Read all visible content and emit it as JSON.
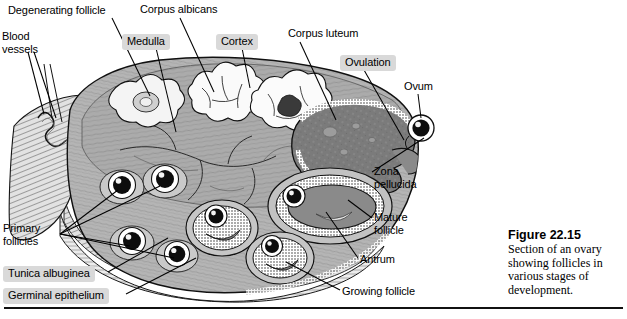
{
  "figure": {
    "number": "Figure 22.15",
    "caption": "Section of an ovary showing follicles in various stages of development."
  },
  "colors": {
    "highlight_box": "#d9d9d9",
    "stroke": "#000000",
    "cortex_fill": "#b3b3b3",
    "medulla_fill": "#a8a8a8",
    "corpus_luteum_fill": "#787878",
    "antrum_fill": "#8a8a8a",
    "follicle_nucleus": "#101010",
    "zona_pellucida": "#ffffff",
    "background": "#ffffff"
  },
  "labels": [
    {
      "id": "degenerating-follicle",
      "text": "Degenerating follicle",
      "highlight": false,
      "x": 8,
      "y": 4
    },
    {
      "id": "blood-vessels",
      "text": "Blood\nvessels",
      "highlight": false,
      "x": 2,
      "y": 30
    },
    {
      "id": "corpus-albicans",
      "text": "Corpus albicans",
      "highlight": false,
      "x": 140,
      "y": 3
    },
    {
      "id": "medulla",
      "text": "Medulla",
      "highlight": true,
      "x": 122,
      "y": 34
    },
    {
      "id": "cortex",
      "text": "Cortex",
      "highlight": true,
      "x": 216,
      "y": 34
    },
    {
      "id": "corpus-luteum",
      "text": "Corpus luteum",
      "highlight": false,
      "x": 288,
      "y": 27
    },
    {
      "id": "ovulation",
      "text": "Ovulation",
      "highlight": true,
      "x": 340,
      "y": 55
    },
    {
      "id": "ovum",
      "text": "Ovum",
      "highlight": false,
      "x": 404,
      "y": 80
    },
    {
      "id": "zona-pellucida",
      "text": "Zona\npellucida",
      "highlight": false,
      "x": 374,
      "y": 165
    },
    {
      "id": "mature-follicle",
      "text": "Mature\nfollicle",
      "highlight": false,
      "x": 374,
      "y": 211
    },
    {
      "id": "antrum",
      "text": "Antrum",
      "highlight": false,
      "x": 360,
      "y": 253
    },
    {
      "id": "growing-follicle",
      "text": "Growing follicle",
      "highlight": false,
      "x": 342,
      "y": 285
    },
    {
      "id": "primary-follicles",
      "text": "Primary\nfollicles",
      "highlight": false,
      "x": 3,
      "y": 222
    },
    {
      "id": "tunica-albuginea",
      "text": "Tunica albuginea",
      "highlight": true,
      "x": 3,
      "y": 266
    },
    {
      "id": "germinal-epithelium",
      "text": "Germinal epithelium",
      "highlight": true,
      "x": 3,
      "y": 288
    }
  ],
  "structures": [
    {
      "id": "ovary-body",
      "name": "ovary cross-section"
    },
    {
      "id": "hilum",
      "name": "hilum with coiled blood vessels"
    },
    {
      "id": "degenerating-follicle-art",
      "name": "degenerating follicle"
    },
    {
      "id": "corpus-albicans-art",
      "name": "corpus albicans"
    },
    {
      "id": "corpus-luteum-art",
      "name": "corpus luteum"
    },
    {
      "id": "mature-follicle-art",
      "name": "mature follicle with antrum"
    },
    {
      "id": "ovum-art",
      "name": "ovulated ovum with zona pellucida"
    },
    {
      "id": "primary-follicle-art",
      "name": "primary follicle"
    },
    {
      "id": "growing-follicle-art",
      "name": "growing follicle"
    },
    {
      "id": "tunica-albuginea-art",
      "name": "tunica albuginea"
    },
    {
      "id": "germinal-epithelium-art",
      "name": "germinal epithelium"
    }
  ]
}
